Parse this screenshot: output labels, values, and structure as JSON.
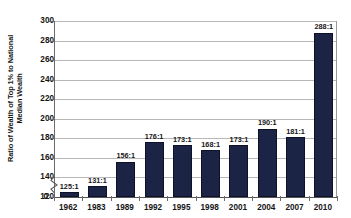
{
  "chart_data": {
    "type": "bar",
    "title": "",
    "xlabel": "",
    "ylabel_line1": "Ratio of Wealth of Top 1% to National",
    "ylabel_line2": "Median Wealth",
    "categories": [
      "1962",
      "1983",
      "1989",
      "1992",
      "1995",
      "1998",
      "2001",
      "2004",
      "2007",
      "2010"
    ],
    "values": [
      125,
      131,
      156,
      176,
      173,
      168,
      173,
      190,
      181,
      288
    ],
    "data_labels": [
      "125:1",
      "131:1",
      "156:1",
      "176:1",
      "173:1",
      "168:1",
      "173:1",
      "190:1",
      "181:1",
      "288:1"
    ],
    "ytick_labels": [
      "300",
      "280",
      "260",
      "240",
      "220",
      "200",
      "180",
      "160",
      "140",
      "120",
      "0"
    ],
    "ytick_values": [
      300,
      280,
      260,
      240,
      220,
      200,
      180,
      160,
      140,
      120,
      0
    ],
    "ylim": [
      120,
      300
    ],
    "axis_break": true,
    "axis_break_between": [
      0,
      120
    ],
    "grid": "horizontal",
    "legend": "none",
    "bar_color": "#1b2444",
    "gridline_color": "#b7b7b7",
    "axis_color": "#555555",
    "background_color": "#ffffff"
  }
}
